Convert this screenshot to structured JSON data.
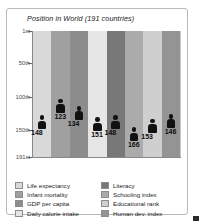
{
  "chart_data": {
    "type": "bar",
    "title": "Position in World (191 countries)",
    "xlabel": "",
    "ylabel": "",
    "grid": true,
    "legend_position": "bottom",
    "ylim": [
      1,
      191
    ],
    "ytick_labels": [
      "1st",
      "50th",
      "100th",
      "150th",
      "191st"
    ],
    "ytick_values": [
      1,
      50,
      100,
      150,
      191
    ],
    "categories": [
      "Life expectancy",
      "Infant mortality",
      "GDP per capita",
      "Daily calorie intake",
      "Literacy",
      "Schooling index",
      "Educational rank",
      "Human dev. index"
    ],
    "values": [
      148,
      123,
      134,
      151,
      148,
      166,
      153,
      146
    ],
    "colors": [
      "#d9d9d9",
      "#a0a0a0",
      "#8c8c8c",
      "#e6e6e6",
      "#787878",
      "#ababab",
      "#cfcfcf",
      "#949494"
    ],
    "marker": "person-icon",
    "annotations": [
      "148",
      "123",
      "134",
      "151",
      "148",
      "166",
      "153",
      "146"
    ]
  },
  "chart": {
    "title": "Position in World (191 countries)",
    "axis": {
      "ticks": [
        {
          "label": "1st"
        },
        {
          "label": "50th"
        },
        {
          "label": "100th"
        },
        {
          "label": "150th"
        },
        {
          "label": "191st"
        }
      ]
    },
    "bars": [
      {
        "name": "Life expectancy",
        "value": "148",
        "color": "#d9d9d9"
      },
      {
        "name": "Infant mortality",
        "value": "123",
        "color": "#a0a0a0"
      },
      {
        "name": "GDP per capita",
        "value": "134",
        "color": "#8c8c8c"
      },
      {
        "name": "Daily calorie intake",
        "value": "151",
        "color": "#e6e6e6"
      },
      {
        "name": "Literacy",
        "value": "148",
        "color": "#787878"
      },
      {
        "name": "Schooling index",
        "value": "166",
        "color": "#ababab"
      },
      {
        "name": "Educational rank",
        "value": "153",
        "color": "#cfcfcf"
      },
      {
        "name": "Human dev. index",
        "value": "146",
        "color": "#949494"
      }
    ]
  },
  "legend": {
    "left": [
      {
        "label": "Life expectancy",
        "color": "#d9d9d9"
      },
      {
        "label": "Infant mortality",
        "color": "#a0a0a0"
      },
      {
        "label": "GDP per capita",
        "color": "#8c8c8c"
      },
      {
        "label": "Daily calorie intake",
        "color": "#e6e6e6"
      }
    ],
    "right": [
      {
        "label": "Literacy",
        "color": "#787878"
      },
      {
        "label": "Schooling index",
        "color": "#ababab"
      },
      {
        "label": "Educational rank",
        "color": "#cfcfcf"
      },
      {
        "label": "Human dev. index",
        "color": "#949494"
      }
    ]
  }
}
